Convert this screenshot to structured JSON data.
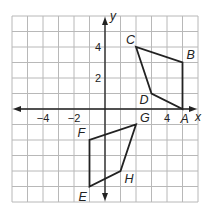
{
  "diagram": {
    "type": "coordinate-plane",
    "grid": {
      "xmin": -6,
      "xmax": 6,
      "ymin": -6,
      "ymax": 6,
      "step": 1
    },
    "axes": {
      "x_label": "x",
      "y_label": "y"
    },
    "x_tick_labels": [
      {
        "value": -4,
        "text": "−4"
      },
      {
        "value": -2,
        "text": "−2"
      },
      {
        "value": 4,
        "text": "4"
      }
    ],
    "y_tick_labels": [
      {
        "value": 4,
        "text": "4"
      },
      {
        "value": 2,
        "text": "2"
      }
    ],
    "shapes": [
      {
        "name": "ABCD",
        "vertices": [
          {
            "label": "A",
            "x": 5,
            "y": 0
          },
          {
            "label": "B",
            "x": 5,
            "y": 3
          },
          {
            "label": "C",
            "x": 2,
            "y": 4
          },
          {
            "label": "D",
            "x": 3,
            "y": 1
          }
        ],
        "order": [
          "A",
          "B",
          "C",
          "D"
        ]
      },
      {
        "name": "EFGH",
        "vertices": [
          {
            "label": "E",
            "x": -1,
            "y": -5
          },
          {
            "label": "F",
            "x": -1,
            "y": -2
          },
          {
            "label": "G",
            "x": 2,
            "y": -1
          },
          {
            "label": "H",
            "x": 1,
            "y": -4
          }
        ],
        "order": [
          "E",
          "F",
          "G",
          "H"
        ]
      }
    ],
    "colors": {
      "grid": "#b8b8b8",
      "axis": "#222222",
      "shape": "#222222"
    }
  }
}
